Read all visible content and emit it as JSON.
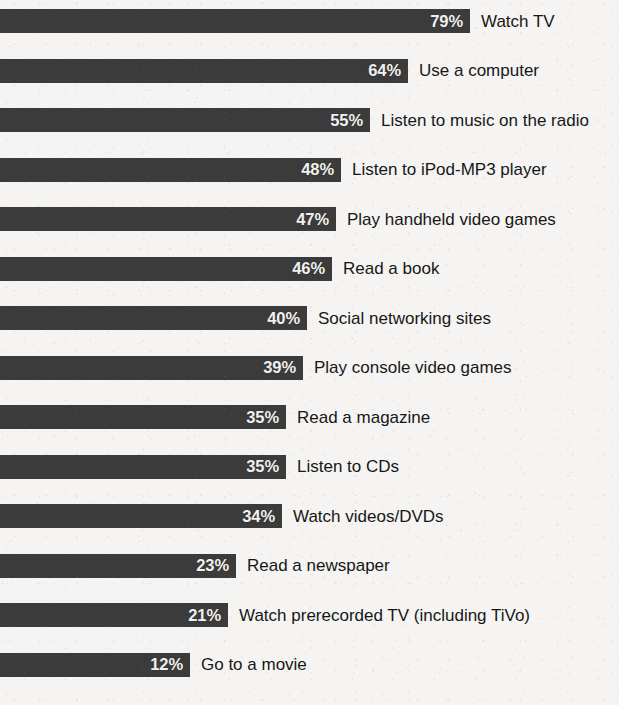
{
  "chart_data": {
    "type": "bar",
    "orientation": "horizontal",
    "title": "",
    "subtitle": "",
    "xlabel": "",
    "ylabel": "",
    "xlim": [
      0,
      100
    ],
    "grid": false,
    "legend": null,
    "value_suffix": "%",
    "categories": [
      "Watch TV",
      "Use a computer",
      "Listen to music on the radio",
      "Listen to iPod-MP3 player",
      "Play handheld video games",
      "Read a book",
      "Social networking sites",
      "Play console video games",
      "Read a magazine",
      "Listen to CDs",
      "Watch videos/DVDs",
      "Read a newspaper",
      "Watch prerecorded TV (including TiVo)",
      "Go to a movie"
    ],
    "values": [
      79,
      64,
      55,
      48,
      47,
      46,
      40,
      39,
      35,
      35,
      34,
      23,
      21,
      12
    ],
    "value_labels": [
      "79%",
      "64%",
      "55%",
      "48%",
      "47%",
      "46%",
      "40%",
      "39%",
      "35%",
      "35%",
      "34%",
      "23%",
      "21%",
      "12%"
    ]
  },
  "colors": {
    "bar_fill": "#3b3b3b",
    "value_text": "#f2f1ef",
    "label_text": "#171717",
    "background": "#f5f4f2"
  },
  "bars": [
    {
      "label": "Watch TV",
      "value_label": "79%",
      "value": 79
    },
    {
      "label": "Use a computer",
      "value_label": "64%",
      "value": 64
    },
    {
      "label": "Listen to music on the radio",
      "value_label": "55%",
      "value": 55
    },
    {
      "label": "Listen to iPod-MP3 player",
      "value_label": "48%",
      "value": 48
    },
    {
      "label": "Play handheld video games",
      "value_label": "47%",
      "value": 47
    },
    {
      "label": "Read a book",
      "value_label": "46%",
      "value": 46
    },
    {
      "label": "Social networking sites",
      "value_label": "40%",
      "value": 40
    },
    {
      "label": "Play console video games",
      "value_label": "39%",
      "value": 39
    },
    {
      "label": "Read a magazine",
      "value_label": "35%",
      "value": 35
    },
    {
      "label": "Listen to CDs",
      "value_label": "35%",
      "value": 35
    },
    {
      "label": "Watch videos/DVDs",
      "value_label": "34%",
      "value": 34
    },
    {
      "label": "Read a newspaper",
      "value_label": "23%",
      "value": 23
    },
    {
      "label": "Watch prerecorded TV (including TiVo)",
      "value_label": "21%",
      "value": 21
    },
    {
      "label": "Go to a movie",
      "value_label": "12%",
      "value": 12
    }
  ]
}
